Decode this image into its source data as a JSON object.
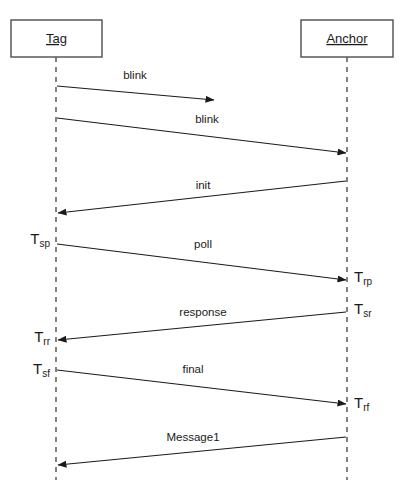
{
  "diagram": {
    "type": "sequence-diagram",
    "width": 400,
    "height": 495,
    "background_color": "#ffffff",
    "line_color": "#1a1a1a",
    "box_stroke_color": "#4d4d4d"
  },
  "participants": [
    {
      "id": "tag",
      "label": "Tag",
      "box": {
        "x": 11,
        "y": 20,
        "width": 91,
        "height": 37
      },
      "lifeline_x": 56,
      "lifeline_top": 57,
      "lifeline_bottom": 480
    },
    {
      "id": "anchor",
      "label": "Anchor",
      "box": {
        "x": 301,
        "y": 20,
        "width": 92,
        "height": 37
      },
      "lifeline_x": 347,
      "lifeline_top": 57,
      "lifeline_bottom": 480
    }
  ],
  "messages": [
    {
      "id": "blink-1",
      "label": "blink",
      "from": "tag",
      "to": "midair",
      "x1": 57,
      "y1": 86,
      "x2": 214,
      "y2": 100,
      "label_x": 135,
      "label_y": 76,
      "arrowhead": "end"
    },
    {
      "id": "blink-2",
      "label": "blink",
      "from": "tag",
      "to": "anchor",
      "x1": 57,
      "y1": 118,
      "x2": 346,
      "y2": 153,
      "label_x": 207,
      "label_y": 120,
      "arrowhead": "end"
    },
    {
      "id": "init",
      "label": "init",
      "from": "anchor",
      "to": "tag",
      "x1": 346,
      "y1": 181,
      "x2": 58,
      "y2": 213,
      "label_x": 203,
      "label_y": 186,
      "arrowhead": "end"
    },
    {
      "id": "poll",
      "label": "poll",
      "from": "tag",
      "to": "anchor",
      "x1": 57,
      "y1": 244,
      "x2": 346,
      "y2": 280,
      "label_x": 203,
      "label_y": 245,
      "arrowhead": "end"
    },
    {
      "id": "response",
      "label": "response",
      "from": "anchor",
      "to": "tag",
      "x1": 346,
      "y1": 312,
      "x2": 58,
      "y2": 340,
      "label_x": 203,
      "label_y": 313,
      "arrowhead": "end"
    },
    {
      "id": "final",
      "label": "final",
      "from": "tag",
      "to": "anchor",
      "x1": 57,
      "y1": 370,
      "x2": 346,
      "y2": 404,
      "label_x": 193,
      "label_y": 370,
      "arrowhead": "end"
    },
    {
      "id": "message1",
      "label": "Message1",
      "from": "anchor",
      "to": "tag",
      "x1": 346,
      "y1": 437,
      "x2": 58,
      "y2": 465,
      "label_x": 193,
      "label_y": 438,
      "arrowhead": "end"
    }
  ],
  "timestamps": [
    {
      "id": "tsp",
      "base": "T",
      "sub": "sp",
      "side": "left",
      "x": 50,
      "y": 240
    },
    {
      "id": "trp",
      "base": "T",
      "sub": "rp",
      "side": "right",
      "x": 354,
      "y": 278
    },
    {
      "id": "tsr",
      "base": "T",
      "sub": "sr",
      "side": "right",
      "x": 354,
      "y": 310
    },
    {
      "id": "trr",
      "base": "T",
      "sub": "rr",
      "side": "left",
      "x": 50,
      "y": 338
    },
    {
      "id": "tsf",
      "base": "T",
      "sub": "sf",
      "side": "left",
      "x": 50,
      "y": 370
    },
    {
      "id": "trf",
      "base": "T",
      "sub": "rf",
      "side": "right",
      "x": 354,
      "y": 404
    }
  ]
}
